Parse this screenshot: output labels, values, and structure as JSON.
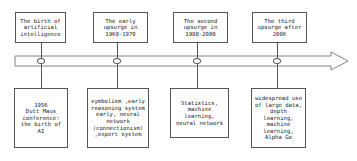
{
  "diagram": {
    "stages": [
      {
        "period": "The birth of\nartificial\nintelligence",
        "details": "1956\nDutt Maus\nconference:\nthe birth of\nAI"
      },
      {
        "period": "The early\nupsurge in\n1960-1970",
        "details": "symbolism ,early\nreasoning system\nearly, neural\nnetwork\n(connectionism)\n,expert system"
      },
      {
        "period": "The second\nupsurge in\n1980-2000",
        "details": "Statistics,\nmachine\nlearning,\nneural network"
      },
      {
        "period": "The third\nupsurge after\n2006",
        "details": "widespread use\nof large data,\ndepth\nlearning,\nmachine\nlearning,\nAlpha Go"
      }
    ],
    "colors": {
      "line": "#555555",
      "background": "#ffffff",
      "text": "#222222"
    }
  }
}
